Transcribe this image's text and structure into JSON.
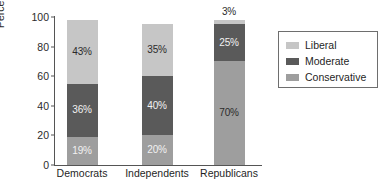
{
  "chart_data": {
    "type": "bar",
    "subtype": "stacked-bar-100-percent",
    "title": "",
    "subtitle": "",
    "xlabel": "",
    "ylabel": "Percentage",
    "ylim": [
      0,
      100
    ],
    "yticks": [
      0,
      20,
      40,
      60,
      80,
      100
    ],
    "ytick_labels": [
      "0",
      "20",
      "40",
      "60",
      "80",
      "100"
    ],
    "grid": false,
    "legend_position": "right",
    "categories": [
      "Democrats",
      "Independents",
      "Republicans"
    ],
    "series": [
      {
        "name": "Conservative",
        "color": "#9e9e9e",
        "values": [
          19,
          20,
          70
        ],
        "labels": [
          "19%",
          "20%",
          "70%"
        ]
      },
      {
        "name": "Moderate",
        "color": "#5a5a5a",
        "values": [
          36,
          40,
          25
        ],
        "labels": [
          "36%",
          "40%",
          "25%"
        ]
      },
      {
        "name": "Liberal",
        "color": "#c6c6c6",
        "values": [
          43,
          35,
          3
        ],
        "labels": [
          "43%",
          "35%",
          "3%"
        ]
      }
    ],
    "stack_order_bottom_to_top": [
      "Conservative",
      "Moderate",
      "Liberal"
    ],
    "bars": [
      {
        "category": "Democrats",
        "total": 98,
        "segments": [
          {
            "series": "Conservative",
            "value": 19,
            "label": "19%",
            "label_color": "on-dark",
            "label_placement": "inside"
          },
          {
            "series": "Moderate",
            "value": 36,
            "label": "36%",
            "label_color": "on-dark",
            "label_placement": "inside"
          },
          {
            "series": "Liberal",
            "value": 43,
            "label": "43%",
            "label_color": "on-light",
            "label_placement": "inside"
          }
        ]
      },
      {
        "category": "Independents",
        "total": 95,
        "segments": [
          {
            "series": "Conservative",
            "value": 20,
            "label": "20%",
            "label_color": "on-dark",
            "label_placement": "inside"
          },
          {
            "series": "Moderate",
            "value": 40,
            "label": "40%",
            "label_color": "on-dark",
            "label_placement": "inside"
          },
          {
            "series": "Liberal",
            "value": 35,
            "label": "35%",
            "label_color": "on-light",
            "label_placement": "inside"
          }
        ]
      },
      {
        "category": "Republicans",
        "total": 98,
        "segments": [
          {
            "series": "Conservative",
            "value": 70,
            "label": "70%",
            "label_color": "on-light",
            "label_placement": "inside"
          },
          {
            "series": "Moderate",
            "value": 25,
            "label": "25%",
            "label_color": "on-dark",
            "label_placement": "inside"
          },
          {
            "series": "Liberal",
            "value": 3,
            "label": "3%",
            "label_color": "on-light",
            "label_placement": "above"
          }
        ]
      }
    ]
  },
  "legend": {
    "items": [
      {
        "label": "Liberal",
        "color": "#c6c6c6"
      },
      {
        "label": "Moderate",
        "color": "#5a5a5a"
      },
      {
        "label": "Conservative",
        "color": "#9e9e9e"
      }
    ]
  },
  "colors": {
    "liberal": "#c6c6c6",
    "moderate": "#5a5a5a",
    "conservative": "#9e9e9e",
    "axis": "#555555",
    "text": "#1f1f1f",
    "background": "#ffffff"
  }
}
